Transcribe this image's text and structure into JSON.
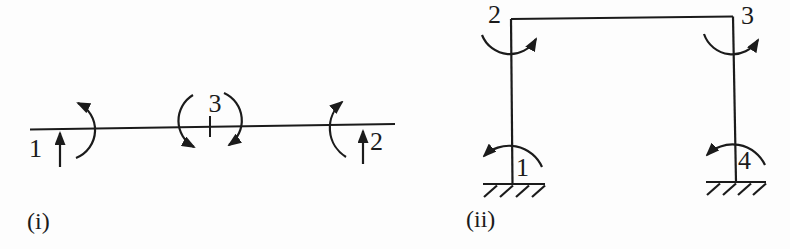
{
  "figure": {
    "ink_color": "#1b1b1b",
    "background_color": "#fdfdfd",
    "diagram_i": {
      "caption": "(i)",
      "labels": {
        "node1": "1",
        "node2": "2",
        "node3": "3"
      }
    },
    "diagram_ii": {
      "caption": "(ii)",
      "labels": {
        "node1": "1",
        "node2": "2",
        "node3": "3",
        "node4": "4"
      }
    }
  }
}
